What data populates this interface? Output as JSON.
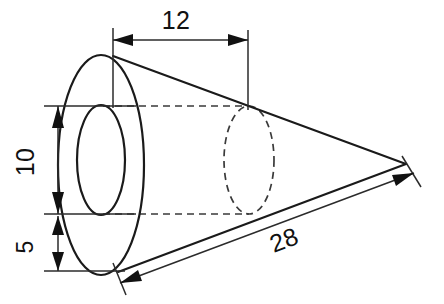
{
  "drawing": {
    "title": "Hollow cone engineering drawing",
    "type": "orthographic-technical-drawing",
    "units_note": "",
    "background_color": "#ffffff",
    "line_color": "#1a1a1a",
    "hidden_line_color": "#3a3a3a",
    "dimension_color": "#2b2b2b"
  },
  "dimensions": [
    {
      "id": "bore-depth",
      "label": "12",
      "orientation": "horizontal",
      "position": "top",
      "text_x": 176,
      "text_y": 29,
      "rotation": 0,
      "line_y": 40,
      "from_x": 113,
      "to_x": 248,
      "arrow_style": "double-filled"
    },
    {
      "id": "bore-diameter",
      "label": "10",
      "orientation": "vertical",
      "position": "left",
      "text_x": 34,
      "text_y": 162,
      "rotation": -90,
      "line_x": 58,
      "from_y": 106,
      "to_y": 214,
      "arrow_style": "double-filled"
    },
    {
      "id": "wall-thickness",
      "label": "5",
      "orientation": "vertical",
      "position": "left-lower",
      "text_x": 33,
      "text_y": 247,
      "rotation": -90,
      "line_x": 58,
      "from_y": 214,
      "to_y": 271,
      "arrow_style": "double-filled"
    },
    {
      "id": "slant-length",
      "label": "28",
      "orientation": "oblique",
      "position": "lower-right",
      "text_x": 287,
      "text_y": 248,
      "rotation": -20.5,
      "from_x": 122,
      "from_y": 282,
      "to_x": 414,
      "to_y": 173,
      "arrow_style": "double-filled"
    }
  ],
  "geometry": {
    "outer_ellipse": {
      "cx": 101,
      "cy": 165,
      "rx": 43,
      "ry": 110
    },
    "inner_ellipse": {
      "cx": 101,
      "cy": 160,
      "rx": 24,
      "ry": 55
    },
    "apex": {
      "x": 406,
      "y": 164
    },
    "upper_edge_start": {
      "x": 113,
      "y": 56
    },
    "lower_edge_start": {
      "x": 118,
      "y": 272
    },
    "hidden_bore_ellipse": {
      "cx": 249,
      "cy": 160,
      "rx": 25,
      "ry": 54
    },
    "hidden_top_line": {
      "x1": 103,
      "y1": 106,
      "x2": 249,
      "y2": 106
    },
    "hidden_bottom_line": {
      "x1": 103,
      "y1": 214,
      "x2": 249,
      "y2": 214
    }
  }
}
